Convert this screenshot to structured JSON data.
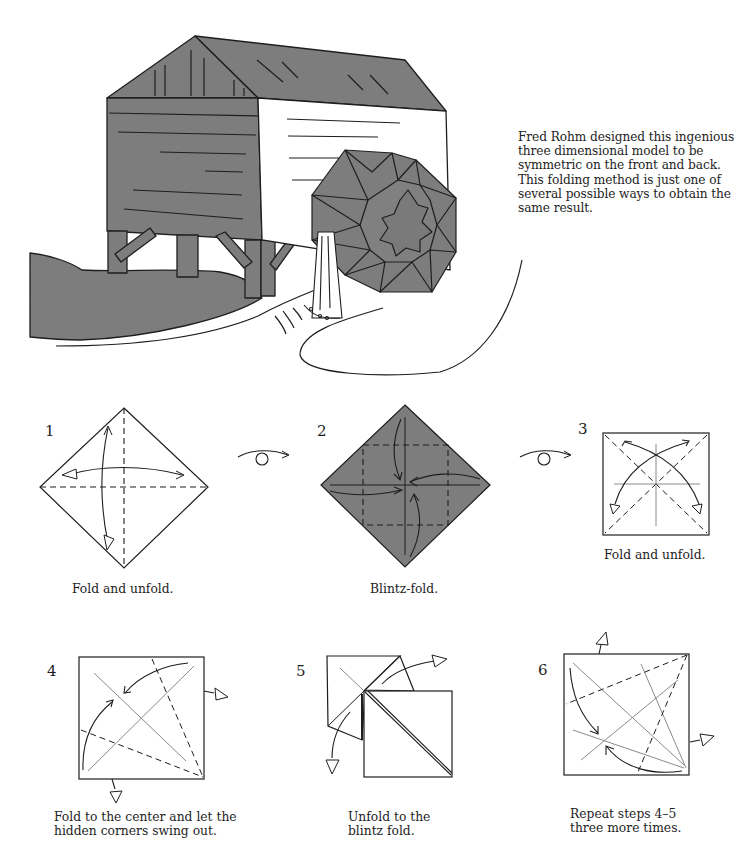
{
  "page": {
    "background": "#ffffff",
    "paper_gray": "#7d7d7d",
    "line_color": "#1e1e1e",
    "reference_line_color": "#8a8a8a"
  },
  "illustration": {
    "subject": "origami water mill with folded water wheel",
    "description": "Mill house on stilts with a three-dimensional modular water wheel and water stream"
  },
  "intro": {
    "text": "Fred Rohm designed this ingenious three dimensional model to be symmetric on the front and back. This folding method is just one of several possible ways to obtain the same result."
  },
  "steps": [
    {
      "number": "1",
      "caption": "Fold and unfold.",
      "paper": "white diamond"
    },
    {
      "number": "2",
      "caption": "Blintz-fold.",
      "paper": "colored diamond"
    },
    {
      "number": "3",
      "caption": "Fold and unfold.",
      "paper": "white square"
    },
    {
      "number": "4",
      "caption_line1": "Fold to the center and let the",
      "caption_line2": "hidden corners swing out.",
      "paper": "white square"
    },
    {
      "number": "5",
      "caption_line1": "Unfold to the",
      "caption_line2": "blintz fold.",
      "paper": "white square"
    },
    {
      "number": "6",
      "caption_line1": "Repeat steps 4–5",
      "caption_line2": "three more times.",
      "paper": "white square"
    }
  ],
  "symbols": {
    "turn_over_1": "turn-over-icon",
    "turn_over_2": "turn-over-icon"
  }
}
